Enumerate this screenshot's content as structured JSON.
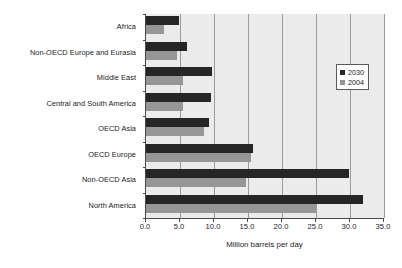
{
  "chart_data": {
    "type": "bar",
    "orientation": "horizontal",
    "title": "",
    "xlabel": "Million barrels per day",
    "ylabel": "",
    "xlim": [
      0.0,
      35.0
    ],
    "xticks": [
      "0.0",
      "5.0",
      "10.0",
      "15.0",
      "20.0",
      "25.0",
      "30.0",
      "35.0"
    ],
    "xtick_values": [
      0,
      5,
      10,
      15,
      20,
      25,
      30,
      35
    ],
    "grid": "vertical",
    "legend_position": "upper right",
    "categories": [
      "Africa",
      "Non-OECD Europe and Eurasia",
      "Middle East",
      "Central and South America",
      "OECD Asia",
      "OECD Europe",
      "Non-OECD Asia",
      "North America"
    ],
    "series": [
      {
        "name": "2030",
        "color": "#262626",
        "values": [
          4.8,
          6.0,
          9.7,
          9.6,
          9.3,
          15.8,
          29.8,
          31.9
        ]
      },
      {
        "name": "2004",
        "color": "#969696",
        "values": [
          2.7,
          4.6,
          5.5,
          5.4,
          8.6,
          15.4,
          14.7,
          25.0
        ]
      }
    ],
    "plot_background": "#ebebeb",
    "gridline_color": "#9a9a9a",
    "axis_color": "#4a4a4a"
  }
}
